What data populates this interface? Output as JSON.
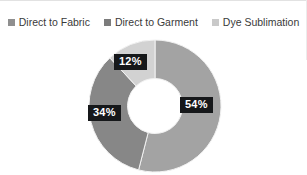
{
  "chart_data": {
    "type": "pie",
    "variant": "donut",
    "title": "",
    "xlabel": "",
    "ylabel": "",
    "legend_position": "top-center",
    "grid": false,
    "start_angle_deg": 0,
    "direction": "clockwise",
    "categories": [
      "Direct to Fabric",
      "Direct to Garment",
      "Dye Sublimation"
    ],
    "values": [
      54,
      34,
      12
    ],
    "value_labels": [
      "54%",
      "34%",
      "12%"
    ],
    "colors": [
      "#a3a3a3",
      "#878787",
      "#d2d2d2"
    ],
    "units": "percent",
    "total": 100
  },
  "legend": {
    "items": [
      {
        "label": "Direct to Fabric",
        "color": "#8f8f8f"
      },
      {
        "label": "Direct to Garment",
        "color": "#7c7c7c"
      },
      {
        "label": "Dye Sublimation",
        "color": "#c9c9c9"
      }
    ]
  },
  "labels": {
    "items": [
      {
        "text": "54%",
        "background": "#16181a",
        "color": "#ffffff"
      },
      {
        "text": "34%",
        "background": "#16181a",
        "color": "#ffffff"
      },
      {
        "text": "12%",
        "background": "#16181a",
        "color": "#ffffff"
      }
    ]
  },
  "canvas": {
    "background": "#ffffff",
    "border_color": "#e2e2e2"
  }
}
